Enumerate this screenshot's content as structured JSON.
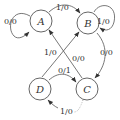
{
  "diagram": {
    "type": "state-machine",
    "states": [
      {
        "id": "A",
        "label": "A",
        "cx": 41,
        "cy": 21
      },
      {
        "id": "B",
        "label": "B",
        "cx": 88,
        "cy": 23
      },
      {
        "id": "C",
        "label": "C",
        "cx": 87,
        "cy": 89
      },
      {
        "id": "D",
        "label": "D",
        "cx": 40,
        "cy": 89
      }
    ],
    "transitions": [
      {
        "from": "A",
        "to": "A",
        "label": "0/0"
      },
      {
        "from": "A",
        "to": "B",
        "label": "1/0"
      },
      {
        "from": "B",
        "to": "B",
        "label": "1/0"
      },
      {
        "from": "B",
        "to": "C",
        "label": "0/0"
      },
      {
        "from": "D",
        "to": "B",
        "label": "1/0"
      },
      {
        "from": "C",
        "to": "A",
        "label": "0/0"
      },
      {
        "from": "D",
        "to": "C",
        "label": "0/1"
      },
      {
        "from": "C",
        "to": "D",
        "label": "1/0"
      }
    ],
    "colors": {
      "stroke": "#555555",
      "text": "#333333",
      "background": "#ffffff"
    }
  }
}
